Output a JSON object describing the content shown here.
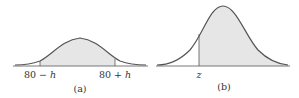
{
  "figure": {
    "panel_a": {
      "caption": "(a)",
      "left_label_num": "80 − ",
      "left_label_var": "h",
      "right_label_num": "80 + ",
      "right_label_var": "h",
      "shaded_region": "between 80 − h and 80 + h"
    },
    "panel_b": {
      "caption": "(b)",
      "z_label": "z",
      "shaded_region": "to the right of z"
    },
    "colors": {
      "curve": "#555555",
      "shade": "#e6e6e6",
      "axis": "#555555",
      "text": "#333333"
    }
  }
}
